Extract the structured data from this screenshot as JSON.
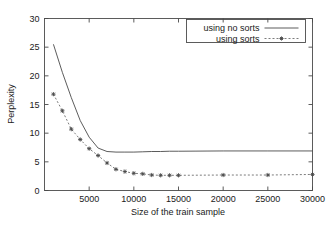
{
  "chart_data": {
    "type": "line",
    "title": "",
    "xlabel": "Size of the train sample",
    "ylabel": "Perplexity",
    "xlim": [
      0,
      30000
    ],
    "ylim": [
      0,
      30
    ],
    "xticks": [
      5000,
      10000,
      15000,
      20000,
      25000,
      30000
    ],
    "xtick_labels": [
      "5000",
      "10000",
      "15000",
      "20000",
      "25000",
      "30000"
    ],
    "yticks": [
      0,
      5,
      10,
      15,
      20,
      25,
      30
    ],
    "ytick_labels": [
      "0",
      "5",
      "10",
      "15",
      "20",
      "25",
      "30"
    ],
    "grid": false,
    "legend_position": "top-right",
    "series": [
      {
        "name": "using no sorts",
        "style": "solid",
        "marker": "none",
        "color": "#4a4a4a",
        "x": [
          1000,
          2000,
          3000,
          4000,
          5000,
          6000,
          7000,
          8000,
          9000,
          10000,
          11000,
          12000,
          13000,
          14000,
          15000,
          20000,
          25000,
          30000
        ],
        "y": [
          25.5,
          20.6,
          16.2,
          12.2,
          9.3,
          7.4,
          6.8,
          6.7,
          6.7,
          6.7,
          6.75,
          6.8,
          6.8,
          6.85,
          6.85,
          6.9,
          6.9,
          6.9
        ]
      },
      {
        "name": "using sorts",
        "style": "dashed",
        "marker": "star",
        "color": "#5a5a5a",
        "x": [
          1000,
          2000,
          3000,
          4000,
          5000,
          6000,
          7000,
          8000,
          9000,
          10000,
          11000,
          12000,
          13000,
          14000,
          15000,
          20000,
          25000,
          30000
        ],
        "y": [
          16.8,
          13.9,
          10.7,
          8.9,
          7.3,
          6.1,
          4.8,
          3.7,
          3.3,
          3.0,
          2.9,
          2.7,
          2.65,
          2.65,
          2.65,
          2.7,
          2.7,
          2.8
        ]
      }
    ]
  },
  "legend": {
    "entries": [
      {
        "label": "using no sorts"
      },
      {
        "label": "using sorts"
      }
    ]
  }
}
